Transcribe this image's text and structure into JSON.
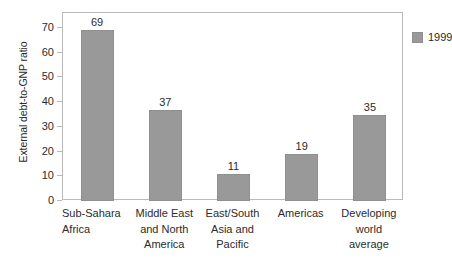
{
  "chart_data": {
    "type": "bar",
    "title": "",
    "xlabel": "",
    "ylabel": "External debt-to-GNP ratio",
    "ylim": [
      0,
      75
    ],
    "ytick_values": [
      0,
      10,
      20,
      30,
      40,
      50,
      60,
      70
    ],
    "ytick_labels": [
      "0",
      "10",
      "20",
      "30",
      "40",
      "50",
      "60",
      "70"
    ],
    "grid": false,
    "legend_position": "top-right",
    "categories": [
      "Sub-Sahara Africa",
      "Middle East and North America",
      "East/South Asia and Pacific",
      "Americas",
      "Developing world average"
    ],
    "category_label_lines": [
      [
        "Sub-Sahara",
        "Africa"
      ],
      [
        "Middle East",
        "and North",
        "America"
      ],
      [
        "East/South",
        "Asia and",
        "Pacific"
      ],
      [
        "Americas"
      ],
      [
        "Developing",
        "world",
        "average"
      ]
    ],
    "series": [
      {
        "name": "1999",
        "values": [
          69,
          37,
          11,
          19,
          35
        ],
        "value_labels": [
          "69",
          "37",
          "11",
          "19",
          "35"
        ],
        "color": "#999999"
      }
    ],
    "legend": [
      {
        "label": "1999",
        "color": "#999999"
      }
    ]
  },
  "colors": {
    "bar_fill": "#999999",
    "bar_edge": "#8f8f8f",
    "frame": "#b9b9b9",
    "text": "#2b2b2b",
    "background": "#ffffff"
  }
}
